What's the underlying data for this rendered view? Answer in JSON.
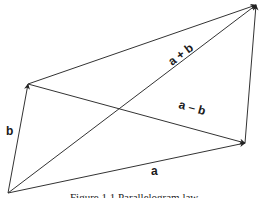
{
  "figure": {
    "caption": "Figure 1.1 Parallelogram law",
    "labels": {
      "a": "a",
      "b": "b",
      "sum": "a + b",
      "diff": "a – b"
    },
    "line_color": "#333333",
    "vertices": {
      "origin": [
        8,
        193
      ],
      "a_tip": [
        245,
        143
      ],
      "b_tip": [
        28,
        84
      ],
      "sum_tip": [
        256,
        5
      ]
    }
  }
}
